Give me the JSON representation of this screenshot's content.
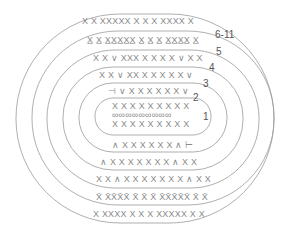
{
  "diagram": {
    "stroke_color": "#9a9a9a",
    "symbol_color": "#8a8a8a",
    "rings": [
      {
        "x": 95,
        "y": 98,
        "w": 116,
        "h": 37,
        "r": 18
      },
      {
        "x": 79,
        "y": 83,
        "w": 148,
        "h": 69,
        "r": 34
      },
      {
        "x": 63,
        "y": 67,
        "w": 180,
        "h": 103,
        "r": 50
      },
      {
        "x": 47,
        "y": 50,
        "w": 212,
        "h": 138,
        "r": 68
      },
      {
        "x": 32,
        "y": 31,
        "w": 242,
        "h": 174,
        "r": 86
      },
      {
        "x": 16,
        "y": 14,
        "w": 258,
        "h": 209,
        "r": 104
      }
    ],
    "row_labels": [
      {
        "text": "1",
        "x": 203,
        "y": 112
      },
      {
        "text": "2",
        "x": 193,
        "y": 93
      },
      {
        "text": "3",
        "x": 203,
        "y": 79
      },
      {
        "text": "4",
        "x": 209,
        "y": 63
      },
      {
        "text": "5",
        "x": 216,
        "y": 47
      },
      {
        "text": "6-11",
        "x": 215,
        "y": 30
      }
    ],
    "symbol_rows": [
      {
        "text": "X X   XXXXX X X X XXXX X",
        "x": 82,
        "y": 17
      },
      {
        "text": "X̲ X̲ X̲X̲X̲X̲X̲ X̲ X̲ X̲ X̲X̲X̲X̲ X̲",
        "x": 87,
        "y": 36
      },
      {
        "text": "X X ∨ XXX X X X X ∨ X X",
        "x": 93,
        "y": 54
      },
      {
        "text": "X X ∨ XX X X X X X  ∨",
        "x": 99,
        "y": 71
      },
      {
        "text": "⊣  ∨ X X X X X X ∨",
        "x": 108,
        "y": 87
      },
      {
        "text": "X X X X X X X X X",
        "x": 112,
        "y": 102
      },
      {
        "text": "∞∞∞∞∞∞∞∞∞",
        "x": 112,
        "y": 111
      },
      {
        "text": "X X X X X X X X X",
        "x": 112,
        "y": 120
      },
      {
        "text": "∧ X X X X X X ∧  ⊢",
        "x": 112,
        "y": 141
      },
      {
        "text": "∧ X X X X X X X ∧ X X",
        "x": 100,
        "y": 158
      },
      {
        "text": "X X ∧ X X X X X X X ∧ X X",
        "x": 96,
        "y": 175
      },
      {
        "text": "X̄ X̄X̄X̄X̄ X̄ X̄ X̄ X̄X̄X̄X̄X̄ X̄ X̄",
        "x": 96,
        "y": 193
      },
      {
        "text": "X  XXXX X X X XXXXX    X X",
        "x": 93,
        "y": 210
      }
    ]
  }
}
